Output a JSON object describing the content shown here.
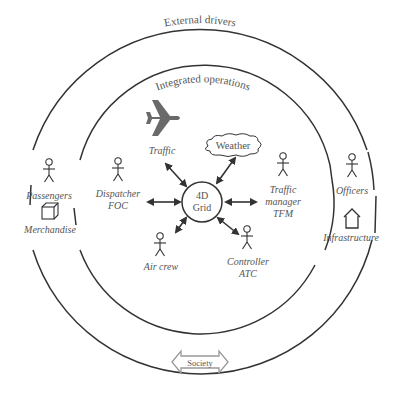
{
  "diagram": {
    "outer_ring": {
      "label": "External drivers"
    },
    "inner_ring": {
      "label": "Integrated operations"
    },
    "center": {
      "line1": "4D",
      "line2": "Grid"
    },
    "nodes": {
      "traffic": {
        "label": "Traffic",
        "icon": "airplane-icon"
      },
      "weather": {
        "label": "Weather",
        "icon": "cloud-icon"
      },
      "dispatcher": {
        "line1": "Dispatcher",
        "line2": "FOC",
        "icon": "stick-figure-icon"
      },
      "tfm": {
        "line1": "Traffic",
        "line2": "manager",
        "line3": "TFM",
        "icon": "stick-figure-icon"
      },
      "aircrew": {
        "label": "Air crew",
        "icon": "stick-figure-icon"
      },
      "controller": {
        "line1": "Controller",
        "line2": "ATC",
        "icon": "stick-figure-icon"
      }
    },
    "external": {
      "passengers": {
        "label": "Passengers",
        "icon": "stick-figure-icon"
      },
      "merchandise": {
        "label": "Merchandise",
        "icon": "box-icon"
      },
      "officers": {
        "label": "Officers",
        "icon": "stick-figure-icon"
      },
      "infrastructure": {
        "label": "Infrastructure",
        "icon": "house-icon"
      }
    },
    "society": {
      "label": "Society",
      "icon": "double-arrow-icon"
    },
    "colors": {
      "line": "#333333",
      "text": "#555555",
      "plane": "#6a6a6a",
      "society_arrow": "#999999"
    }
  }
}
